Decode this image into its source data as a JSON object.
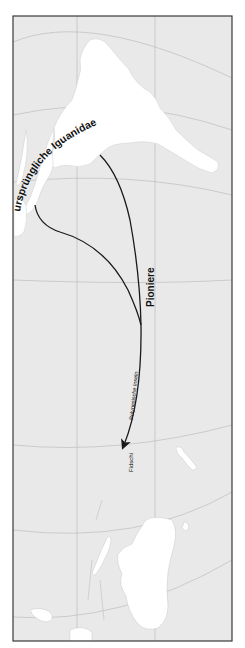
{
  "map": {
    "colors": {
      "ocean": "#e9e9e9",
      "land": "#ffffff",
      "grid": "#b9b9b9",
      "frame": "#3a3a3a",
      "route": "#1a1a1a",
      "text": "#111111"
    },
    "labels": {
      "origin": "ursprüngliche Iguanidae",
      "pioneers": "Pioniere",
      "polynesia": "Polynesische Inseln",
      "fiji": "Fidschi"
    },
    "routes": [
      {
        "name": "route-pioneers",
        "from": "South America",
        "to": "Fidschi"
      },
      {
        "name": "route-secondary",
        "from": "Central America",
        "joins": "route-pioneers"
      }
    ]
  }
}
